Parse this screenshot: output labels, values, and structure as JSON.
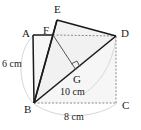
{
  "figure": {
    "type": "geometry-diagram",
    "colors": {
      "stroke_solid": "#1a1a1a",
      "stroke_dashed": "#8a8a8a",
      "arc": "#c8c8c8",
      "fill_shade": "#f4f4f4",
      "background": "#ffffff",
      "text": "#1a1a1a"
    },
    "vertex_labels": [
      {
        "id": "A",
        "text": "A",
        "x": 22,
        "y": 28
      },
      {
        "id": "B",
        "text": "B",
        "x": 24,
        "y": 104
      },
      {
        "id": "C",
        "text": "C",
        "x": 122,
        "y": 100
      },
      {
        "id": "D",
        "text": "D",
        "x": 121,
        "y": 28
      },
      {
        "id": "E",
        "text": "E",
        "x": 54,
        "y": 4
      },
      {
        "id": "F",
        "text": "F",
        "x": 43,
        "y": 25
      },
      {
        "id": "G",
        "text": "G",
        "x": 73,
        "y": 75
      }
    ],
    "dimension_labels": [
      {
        "id": "side-ab",
        "text": "6 cm",
        "x": 2,
        "y": 59
      },
      {
        "id": "diagonal-bd",
        "text": "10 cm",
        "x": 60,
        "y": 88
      },
      {
        "id": "side-bc",
        "text": "8 cm",
        "x": 64,
        "y": 113
      }
    ],
    "points": {
      "A": {
        "x": 33,
        "y": 35
      },
      "B": {
        "x": 34,
        "y": 103
      },
      "C": {
        "x": 116,
        "y": 103
      },
      "D": {
        "x": 116,
        "y": 36
      },
      "E": {
        "x": 57,
        "y": 20
      },
      "F": {
        "x": 53,
        "y": 35
      },
      "G": {
        "x": 76,
        "y": 70
      }
    },
    "segments": [
      {
        "id": "AB",
        "from": "A",
        "to": "B",
        "style": "solid"
      },
      {
        "id": "AF",
        "from": "A",
        "to": "F",
        "style": "solid"
      },
      {
        "id": "FD",
        "from": "F",
        "to": "D",
        "style": "dashed"
      },
      {
        "id": "BC",
        "from": "B",
        "to": "C",
        "style": "dashed"
      },
      {
        "id": "CD",
        "from": "C",
        "to": "D",
        "style": "dashed"
      },
      {
        "id": "BD",
        "from": "B",
        "to": "D",
        "style": "solid"
      },
      {
        "id": "BE",
        "from": "B",
        "to": "E",
        "style": "solid"
      },
      {
        "id": "BF",
        "from": "B",
        "to": "F",
        "style": "solid"
      },
      {
        "id": "EF",
        "from": "E",
        "to": "F",
        "style": "solid"
      },
      {
        "id": "ED",
        "from": "E",
        "to": "D",
        "style": "solid"
      },
      {
        "id": "FG",
        "from": "F",
        "to": "G",
        "style": "solid"
      }
    ],
    "right_angle": {
      "id": "right-angle-at-G",
      "x": 76,
      "y": 70
    },
    "arcs": [
      {
        "id": "arc-left",
        "d": "M 33 36 C 16 52 18 88 33 103"
      },
      {
        "id": "arc-bottom",
        "d": "M 34 104 C 60 122 100 117 117 103"
      },
      {
        "id": "arc-right",
        "d": "M 116 37 C 112 62 100 84 80 96"
      }
    ]
  }
}
